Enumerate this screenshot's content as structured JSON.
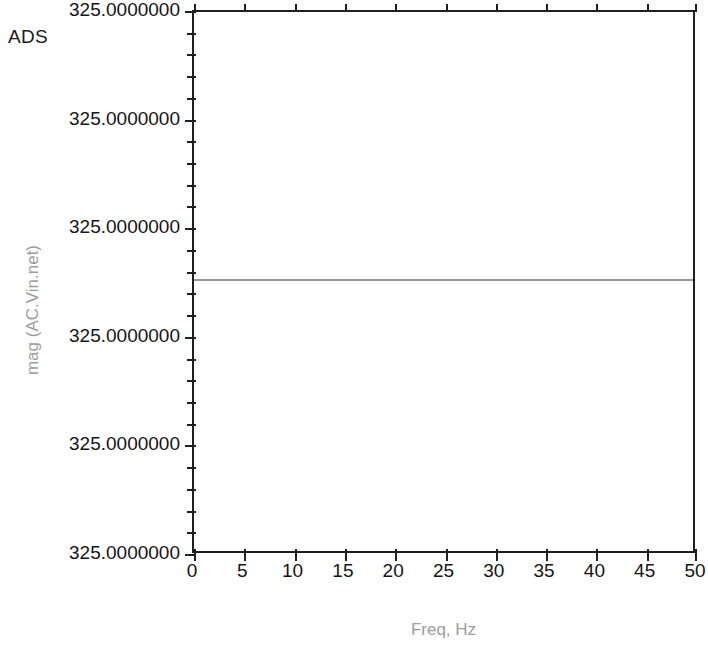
{
  "app": {
    "watermark": "ADS"
  },
  "chart_data": {
    "type": "line",
    "title": "",
    "subtitle": "",
    "xlabel": "Freq, Hz",
    "ylabel": "mag (AC.Vin.net)",
    "xlim": [
      0,
      50
    ],
    "x_ticks": [
      0,
      5,
      10,
      15,
      20,
      25,
      30,
      35,
      40,
      45,
      50
    ],
    "x_tick_labels": [
      "0",
      "5",
      "10",
      "15",
      "20",
      "25",
      "30",
      "35",
      "40",
      "45",
      "50"
    ],
    "x_minor_per_major": 1,
    "y_tick_labels": [
      "325.0000000",
      "325.0000000",
      "325.0000000",
      "325.0000000",
      "325.0000000",
      "325.0000000"
    ],
    "y_minor_per_major": 4,
    "grid": false,
    "legend": null,
    "series": [
      {
        "name": "mag (AC.Vin.net)",
        "color": "#9a9a9a",
        "x": [
          0,
          5,
          10,
          15,
          20,
          25,
          30,
          35,
          40,
          45,
          50
        ],
        "values": [
          325.0,
          325.0,
          325.0,
          325.0,
          325.0,
          325.0,
          325.0,
          325.0,
          325.0,
          325.0,
          325.0
        ],
        "constant_level_fraction": 0.492
      }
    ],
    "annotations": [],
    "colors": {
      "axis": "#1f1f1f",
      "tick_text": "#151515",
      "axis_title": "#9d9d9d",
      "trace": "#9a9a9a",
      "background": "#ffffff"
    }
  }
}
